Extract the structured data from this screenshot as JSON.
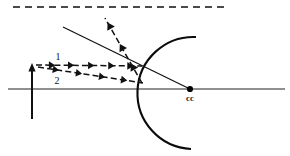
{
  "figure": {
    "canvas": {
      "width": 290,
      "height": 156,
      "background": "#ffffff"
    },
    "ink_color": "#111111"
  },
  "labels": {
    "ray_one": "1",
    "ray_two": "2",
    "center_of_curvature": "cc"
  },
  "elements": {
    "optical_axis": {
      "name": "optical-axis",
      "x1": 8,
      "y1": 89,
      "x2": 285,
      "y2": 89,
      "style": "solid"
    },
    "top_dashed_reference": {
      "name": "top-dashed-reference-line",
      "x1": 13,
      "y1": 7,
      "x2": 226,
      "y2": 7,
      "style": "dashed"
    },
    "object_arrow": {
      "name": "object-arrow",
      "x": 32,
      "y_base": 119,
      "y_tip": 64,
      "direction": "up"
    },
    "mirror_arc": {
      "name": "concave-mirror-arc",
      "vertex_x": 139,
      "center_x": 190,
      "center_y": 89,
      "radius": 51,
      "top_end": {
        "x": 196,
        "y": 37
      },
      "bottom_end": {
        "x": 191,
        "y": 149
      }
    },
    "center_of_curvature_point": {
      "name": "center-of-curvature-point",
      "x": 190,
      "y": 89,
      "radius": 3.1
    },
    "incident_ray_1": {
      "name": "incident-ray-1",
      "x1": 36,
      "y1": 65,
      "x2": 142,
      "y2": 66,
      "style": "dashed",
      "arrow_positions": [
        0.18,
        0.36,
        0.55,
        0.74,
        0.92
      ]
    },
    "incident_ray_2": {
      "name": "incident-ray-2",
      "x1": 38,
      "y1": 67,
      "x2": 143,
      "y2": 83,
      "style": "dashed",
      "arrow_positions": [
        0.2,
        0.42,
        0.64,
        0.85
      ]
    },
    "reflected_ray_dashed": {
      "name": "reflected-ray-dashed",
      "x1": 142,
      "y1": 83,
      "x2": 105,
      "y2": 18,
      "style": "dashed",
      "arrow_positions": [
        0.3,
        0.6,
        0.93
      ]
    },
    "normal_line_solid": {
      "name": "normal-line-through-center",
      "x1": 63,
      "y1": 27,
      "x2": 190,
      "y2": 89,
      "style": "solid"
    }
  }
}
